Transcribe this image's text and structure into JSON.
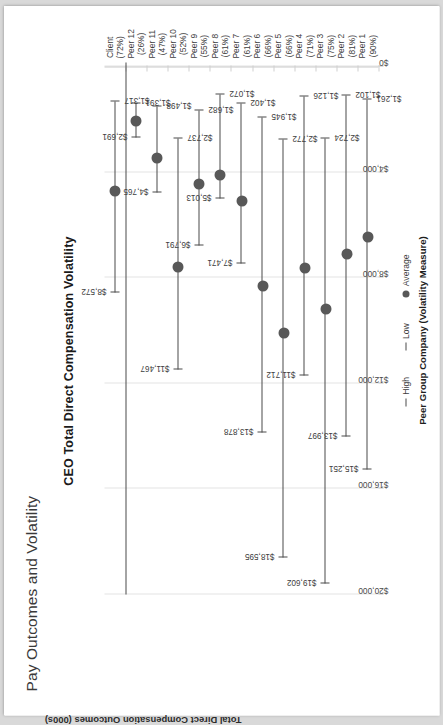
{
  "page": {
    "heading": "Pay Outcomes and Volatility"
  },
  "chart_data": {
    "type": "scatter",
    "title": "CEO Total Direct Compensation Volatility",
    "xlabel": "Peer Group Company (Volatility Measure)",
    "ylabel": "Total Direct Compensation Outcomes (000s)",
    "ylim": [
      0,
      20000
    ],
    "ytick_labels": [
      "$20,000",
      "$16,000",
      "$12,000",
      "$8,000",
      "$4,000",
      "$0"
    ],
    "ytick_values": [
      20000,
      16000,
      12000,
      8000,
      4000,
      0
    ],
    "grid": true,
    "legend_position": "bottom",
    "legend": [
      {
        "marker": "dash",
        "label": "High"
      },
      {
        "marker": "dash",
        "label": "Low"
      },
      {
        "marker": "dot",
        "label": "Average"
      }
    ],
    "categories": [
      "Peer 1",
      "Peer 2",
      "Peer 3",
      "Peer 4",
      "Peer 5",
      "Peer 6",
      "Peer 7",
      "Peer 8",
      "Peer 9",
      "Peer 10",
      "Peer 11",
      "Peer 12",
      "Client"
    ],
    "volatility": [
      "(90%)",
      "(81%)",
      "(75%)",
      "(71%)",
      "(66%)",
      "(66%)",
      "(61%)",
      "(61%)",
      "(55%)",
      "(52%)",
      "(47%)",
      "(26%)",
      "(72%)"
    ],
    "series": [
      {
        "name": "High",
        "values": [
          15251,
          13997,
          19602,
          11712,
          18595,
          13878,
          7471,
          5013,
          6791,
          11467,
          4765,
          2691,
          8572
        ],
        "labels": [
          "$15,251",
          "$13,997",
          "$19,602",
          "$11,712",
          "$18,595",
          "$13,878",
          "$7,471",
          "$5,013",
          "$6,791",
          "$11,467",
          "$4,765",
          "$2,691",
          "$8,572"
        ]
      },
      {
        "name": "Low",
        "values": [
          1261,
          1102,
          2724,
          1126,
          2772,
          1945,
          1402,
          1072,
          1682,
          2737,
          1498,
          1391,
          1317
        ],
        "labels": [
          "$1,261",
          "$1,102",
          "$2,724",
          "$1,126",
          "$2,772",
          "$1,945",
          "$1,402",
          "$1,072",
          "$1,682",
          "$2,737",
          "$1,498",
          "$1,391",
          "$1,317"
        ]
      },
      {
        "name": "Average",
        "values": [
          6460,
          7120,
          9200,
          7650,
          10100,
          8300,
          5100,
          4100,
          4450,
          7600,
          3450,
          2050,
          4700
        ]
      }
    ],
    "colors": {
      "marker": "#585858",
      "line": "#4a4a4a",
      "grid": "#e3e3e3",
      "text": "#3d3d3d"
    }
  }
}
